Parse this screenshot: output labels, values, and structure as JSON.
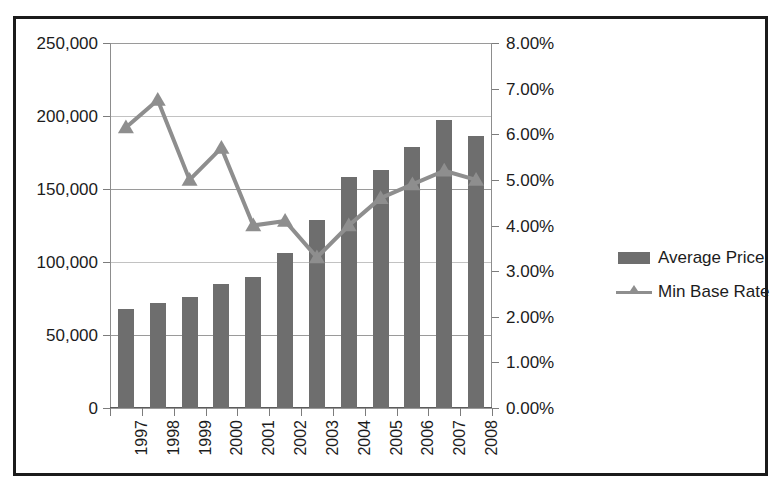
{
  "chart_data": {
    "type": "bar",
    "title": "",
    "xlabel": "",
    "categories": [
      "1997",
      "1998",
      "1999",
      "2000",
      "2001",
      "2002",
      "2003",
      "2004",
      "2005",
      "2006",
      "2007",
      "2008"
    ],
    "grid": true,
    "legend_position": "right",
    "series": [
      {
        "name": "Average Price",
        "type": "bar",
        "axis": "left",
        "color": "#6e6e6e",
        "values": [
          68000,
          72000,
          76000,
          85000,
          90000,
          106000,
          129000,
          158000,
          163000,
          179000,
          197000,
          186000
        ]
      },
      {
        "name": "Min Base Rate",
        "type": "line",
        "axis": "right",
        "color": "#8e8e8e",
        "marker": "triangle",
        "values": [
          6.15,
          6.75,
          5.0,
          5.7,
          4.0,
          4.1,
          3.3,
          4.0,
          4.6,
          4.9,
          5.2,
          5.0
        ]
      }
    ],
    "left_axis": {
      "label": "",
      "ylim": [
        0,
        250000
      ],
      "tick_step": 50000,
      "ticks": [
        "0",
        "50,000",
        "100,000",
        "150,000",
        "200,000",
        "250,000"
      ],
      "tick_values": [
        0,
        50000,
        100000,
        150000,
        200000,
        250000
      ]
    },
    "right_axis": {
      "label": "",
      "ylim": [
        0,
        8
      ],
      "tick_step": 1,
      "ticks": [
        "0.00%",
        "1.00%",
        "2.00%",
        "3.00%",
        "4.00%",
        "5.00%",
        "6.00%",
        "7.00%",
        "8.00%"
      ],
      "tick_values": [
        0,
        1,
        2,
        3,
        4,
        5,
        6,
        7,
        8
      ]
    },
    "legend": [
      {
        "label": "Average Price",
        "key": "bar-swatch"
      },
      {
        "label": "Min Base Rate",
        "key": "line-swatch"
      }
    ]
  }
}
